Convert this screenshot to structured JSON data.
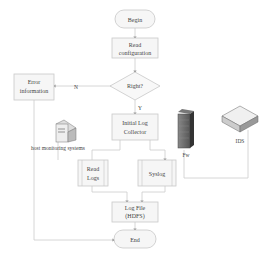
{
  "nodes": {
    "begin": {
      "label": "Begin"
    },
    "read_config": {
      "line1": "Read",
      "line2": "configuration"
    },
    "right": {
      "label": "Right?"
    },
    "error": {
      "line1": "Error",
      "line2": "information"
    },
    "initial": {
      "line1": "Initial Log",
      "line2": "Collector"
    },
    "read_logs": {
      "line1": "Read",
      "line2": "Logs"
    },
    "syslog": {
      "label": "Syslog"
    },
    "logfile": {
      "line1": "Log File",
      "line2": "(HDFS)"
    },
    "end": {
      "label": "End"
    }
  },
  "edges": {
    "no_label": "N",
    "yes_label": "Y"
  },
  "devices": {
    "host": {
      "label": "host monitoring systems"
    },
    "fw": {
      "label": "Fw"
    },
    "ids": {
      "label": "IDS"
    }
  },
  "colors": {
    "box_fill": "#f6f6f6",
    "box_stroke": "#c8c8c8",
    "line": "#cccccc",
    "text": "#444444"
  }
}
